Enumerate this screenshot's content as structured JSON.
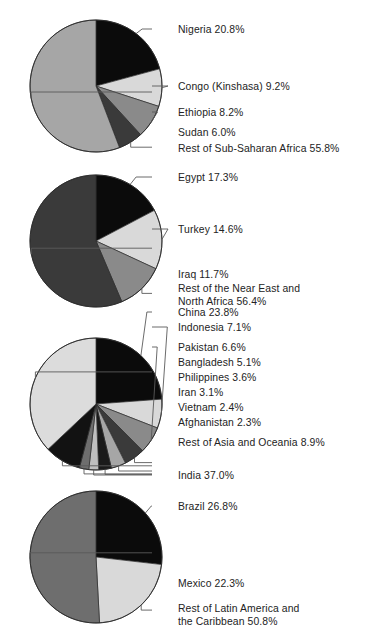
{
  "figure": {
    "width": 372,
    "height": 638,
    "background": "#ffffff",
    "label_color": "#232323",
    "leader_color": "#5a5a5a"
  },
  "chart_data": [
    {
      "type": "pie",
      "title": "Sub-Saharan Africa",
      "center": [
        96,
        86
      ],
      "radius": 66,
      "start_angle": 0,
      "direction": "clockwise",
      "labels": [
        "Nigeria",
        "Congo (Kinshasa)",
        "Ethiopia",
        "Sudan",
        "Rest of Sub-Saharan Africa"
      ],
      "values": [
        20.8,
        9.2,
        8.2,
        6.0,
        55.8
      ],
      "value_strings": [
        "20.8%",
        "9.2%",
        "8.2%",
        "6.0%",
        "55.8%"
      ],
      "label_strings": [
        "Nigeria  20.8%",
        "Congo (Kinshasa)  9.2%",
        "Ethiopia  8.2%",
        "Sudan  6.0%",
        "Rest of Sub-Saharan Africa  55.8%"
      ],
      "colors": [
        "#0b0b0b",
        "#d9d9d9",
        "#8a8a8a",
        "#3a3a3a",
        "#a6a6a6"
      ],
      "label_y": [
        33,
        90,
        116,
        136,
        152
      ],
      "label_x": 178,
      "leader_start_x": 152
    },
    {
      "type": "pie",
      "title": "Near East and North Africa",
      "center": [
        96,
        241
      ],
      "radius": 66,
      "start_angle": 0,
      "direction": "clockwise",
      "labels": [
        "Egypt",
        "Turkey",
        "Iraq",
        "Rest of the Near East and North Africa"
      ],
      "values": [
        17.3,
        14.6,
        11.7,
        56.4
      ],
      "value_strings": [
        "17.3%",
        "14.6%",
        "11.7%",
        "56.4%"
      ],
      "label_strings": [
        "Egypt  17.3%",
        "Turkey  14.6%",
        "Iraq  11.7%",
        "Rest of the Near East and North Africa  56.4%"
      ],
      "label_lines": [
        [
          "Egypt  17.3%"
        ],
        [
          "Turkey  14.6%"
        ],
        [
          "Iraq  11.7%"
        ],
        [
          "Rest of the Near East and",
          "North Africa  56.4%"
        ]
      ],
      "colors": [
        "#0b0b0b",
        "#d9d9d9",
        "#8a8a8a",
        "#3a3a3a"
      ],
      "label_y": [
        181,
        233,
        278,
        292
      ],
      "label_x": 178,
      "leader_start_x": 152
    },
    {
      "type": "pie",
      "title": "Asia and Oceania",
      "center": [
        96,
        404
      ],
      "radius": 66,
      "start_angle": 0,
      "direction": "clockwise",
      "labels": [
        "China",
        "Indonesia",
        "Pakistan",
        "Bangladesh",
        "Philippines",
        "Iran",
        "Vietnam",
        "Afghanistan",
        "Rest of Asia and Oceania",
        "India"
      ],
      "values": [
        23.8,
        7.1,
        6.6,
        5.1,
        3.6,
        3.1,
        2.4,
        2.3,
        8.9,
        37.0
      ],
      "value_strings": [
        "23.8%",
        "7.1%",
        "6.6%",
        "5.1%",
        "3.6%",
        "3.1%",
        "2.4%",
        "2.3%",
        "8.9%",
        "37.0%"
      ],
      "label_strings": [
        "China  23.8%",
        "Indonesia  7.1%",
        "Pakistan  6.6%",
        "Bangladesh  5.1%",
        "Philippines  3.6%",
        "Iran  3.1%",
        "Vietnam  2.4%",
        "Afghanistan  2.3%",
        "Rest of Asia and Oceania  8.9%",
        "India  37.0%"
      ],
      "colors": [
        "#0b0b0b",
        "#d9d9d9",
        "#8a8a8a",
        "#3a3a3a",
        "#a6a6a6",
        "#1a1a1a",
        "#bfbfbf",
        "#6e6e6e",
        "#121212",
        "#dcdcdc"
      ],
      "label_y": [
        316,
        331,
        351,
        366,
        381,
        396,
        411,
        426,
        446,
        479
      ],
      "label_x": 178,
      "leader_start_x": 152
    },
    {
      "type": "pie",
      "title": "Latin America and the Caribbean",
      "center": [
        96,
        557
      ],
      "radius": 66,
      "start_angle": 0,
      "direction": "clockwise",
      "labels": [
        "Brazil",
        "Mexico",
        "Rest of Latin America and the Caribbean"
      ],
      "values": [
        26.8,
        22.3,
        50.8
      ],
      "value_strings": [
        "26.8%",
        "22.3%",
        "50.8%"
      ],
      "label_strings": [
        "Brazil  26.8%",
        "Mexico  22.3%",
        "Rest of Latin America and the Caribbean  50.8%"
      ],
      "label_lines": [
        [
          "Brazil  26.8%"
        ],
        [
          "Mexico  22.3%"
        ],
        [
          "Rest of Latin America and",
          "the Caribbean  50.8%"
        ]
      ],
      "colors": [
        "#0b0b0b",
        "#d9d9d9",
        "#6e6e6e"
      ],
      "label_y": [
        510,
        587,
        612
      ],
      "label_x": 178,
      "leader_start_x": 152
    }
  ]
}
